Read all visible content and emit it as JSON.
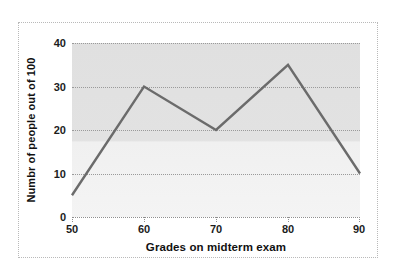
{
  "chart_data": {
    "type": "line",
    "title": "",
    "subtitle": "",
    "xlabel": "Grades on midterm exam",
    "ylabel": "Numbr of people out of 100",
    "x": [
      50,
      60,
      70,
      80,
      90
    ],
    "values": [
      5,
      30,
      20,
      35,
      10
    ],
    "series": [
      {
        "name": "",
        "x": [
          50,
          60,
          70,
          80,
          90
        ],
        "values": [
          5,
          30,
          20,
          35,
          10
        ]
      }
    ],
    "xlim": [
      50,
      90
    ],
    "ylim": [
      0,
      40
    ],
    "xticks": [
      "50",
      "60",
      "70",
      "80",
      "90"
    ],
    "yticks": [
      "0",
      "10",
      "20",
      "30",
      "40"
    ],
    "xtick_values": [
      50,
      60,
      70,
      80,
      90
    ],
    "ytick_values": [
      0,
      10,
      20,
      30,
      40
    ],
    "grid": true,
    "grid_style": "dotted",
    "legend": false,
    "legend_position": "none",
    "annotations": [],
    "colors": {
      "line": "#6b6b6b",
      "plot_background_upper": "#e0e0e0",
      "plot_background_lower": "#f3f3f3",
      "gridline": "#9a9a9a",
      "text": "#111111",
      "frame": "#b9b9b9",
      "figure_background": "#ffffff"
    },
    "line_width": 2.4
  }
}
